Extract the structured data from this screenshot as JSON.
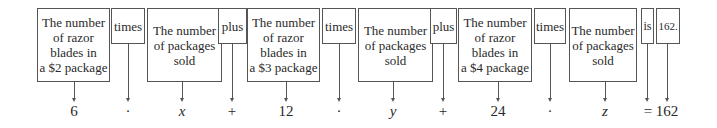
{
  "diagram": {
    "boxes": [
      {
        "id": "rb2",
        "text": "The number of razor blades in a $2 package",
        "lines": [
          "The number",
          "of razor",
          "blades in",
          "a $2 package"
        ]
      },
      {
        "id": "times1",
        "text": "times"
      },
      {
        "id": "pk1",
        "text": "The number of packages sold",
        "lines": [
          "The number",
          "of packages",
          "sold"
        ]
      },
      {
        "id": "plus1",
        "text": "plus"
      },
      {
        "id": "rb3",
        "text": "The number of razor blades in a $3 package",
        "lines": [
          "The number",
          "of razor",
          "blades in",
          "a $3 package"
        ]
      },
      {
        "id": "times2",
        "text": "times"
      },
      {
        "id": "pk2",
        "text": "The number of packages sold",
        "lines": [
          "The number",
          "of packages",
          "sold"
        ]
      },
      {
        "id": "plus2",
        "text": "plus"
      },
      {
        "id": "rb4",
        "text": "The number of razor blades in a $4 package",
        "lines": [
          "The number",
          "of razor",
          "blades in",
          "a $4 package"
        ]
      },
      {
        "id": "times3",
        "text": "times"
      },
      {
        "id": "pk3",
        "text": "The number of packages sold",
        "lines": [
          "The number",
          "of packages",
          "sold"
        ]
      },
      {
        "id": "is",
        "text": "is"
      },
      {
        "id": "total",
        "text": "162."
      }
    ],
    "symbols": [
      "6",
      "·",
      "x",
      "+",
      "12",
      "·",
      "y",
      "+",
      "24",
      "·",
      "z",
      "= 162"
    ],
    "equation": "6 · x + 12 · y + 24 · z = 162"
  }
}
